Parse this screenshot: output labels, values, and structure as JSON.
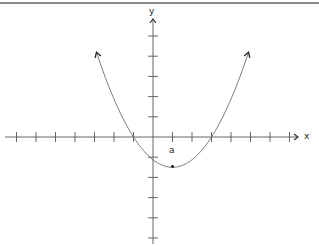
{
  "diagram": {
    "type": "parabola-graph",
    "axes": {
      "x_label": "x",
      "y_label": "y",
      "x_ticks": [
        -7,
        -6,
        -5,
        -4,
        -3,
        -2,
        -1,
        1,
        2,
        3,
        4,
        5,
        6,
        7
      ],
      "y_ticks": [
        -5,
        -4,
        -3,
        -2,
        -1,
        1,
        2,
        3,
        4,
        5
      ]
    },
    "curve": {
      "shape": "upward-opening parabola",
      "x_intercepts": [
        -1,
        3
      ],
      "vertex": [
        1,
        -1.5
      ],
      "arrows_at_ends": true
    },
    "annotations": {
      "vertex_label": "a"
    },
    "colors": {
      "axis": "#555555",
      "curve": "#6b6b6b",
      "border": "#666666"
    }
  }
}
